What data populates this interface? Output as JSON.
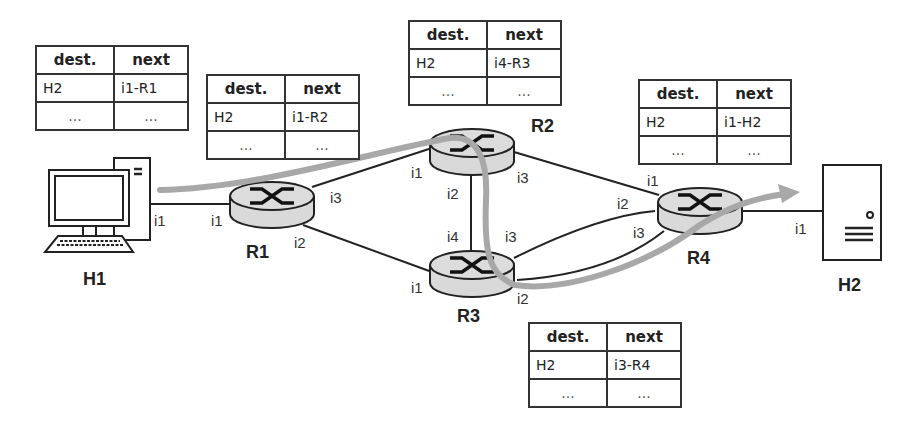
{
  "nodes": {
    "h1": {
      "label": "H1"
    },
    "h2": {
      "label": "H2"
    },
    "r1": {
      "label": "R1"
    },
    "r2": {
      "label": "R2"
    },
    "r3": {
      "label": "R3"
    },
    "r4": {
      "label": "R4"
    }
  },
  "interfaces": {
    "h1_i1": "i1",
    "r1_i1": "i1",
    "r1_i2": "i2",
    "r1_i3": "i3",
    "r2_i1": "i1",
    "r2_i2": "i2",
    "r2_i3": "i3",
    "r3_i1": "i1",
    "r3_i2": "i2",
    "r3_i3": "i3",
    "r3_i4": "i4",
    "r4_i1": "i1",
    "r4_i2": "i2",
    "r4_i3": "i3",
    "h2_i1": "i1"
  },
  "tables": {
    "h1": {
      "header": [
        "dest.",
        "next"
      ],
      "rows": [
        [
          "H2",
          "i1-R1"
        ],
        [
          "...",
          "..."
        ]
      ]
    },
    "r1": {
      "header": [
        "dest.",
        "next"
      ],
      "rows": [
        [
          "H2",
          "i1-R2"
        ],
        [
          "...",
          "..."
        ]
      ]
    },
    "r2": {
      "header": [
        "dest.",
        "next"
      ],
      "rows": [
        [
          "H2",
          "i4-R3"
        ],
        [
          "...",
          "..."
        ]
      ]
    },
    "r4": {
      "header": [
        "dest.",
        "next"
      ],
      "rows": [
        [
          "H2",
          "i1-H2"
        ],
        [
          "...",
          "..."
        ]
      ]
    },
    "r3": {
      "header": [
        "dest.",
        "next"
      ],
      "rows": [
        [
          "H2",
          "i3-R4"
        ],
        [
          "...",
          "..."
        ]
      ]
    }
  },
  "colors": {
    "path_arrow": "#a8a8a8",
    "router_fill": "#d9d9d9",
    "line": "#222222"
  }
}
